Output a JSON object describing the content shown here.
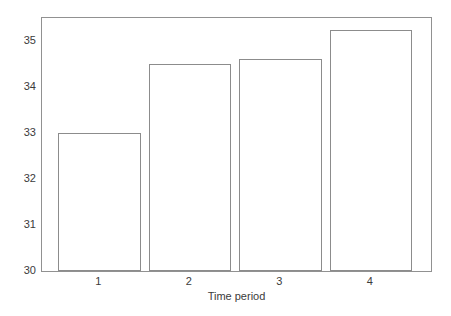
{
  "chart_data": {
    "type": "bar",
    "categories": [
      "1",
      "2",
      "3",
      "4"
    ],
    "values": [
      33.0,
      34.5,
      34.6,
      35.25
    ],
    "title": "",
    "xlabel": "Time period",
    "ylabel": "",
    "ylim": [
      30,
      35.5
    ],
    "yticks": [
      30,
      31,
      32,
      33,
      34,
      35
    ],
    "grid": "off",
    "legend": "none",
    "colors": {
      "background": "#ffffff",
      "bar_fill": "#ffffff",
      "bar_outline": "#8c8c8c",
      "frame_line": "#919191",
      "text": "#3b3b3b"
    }
  }
}
